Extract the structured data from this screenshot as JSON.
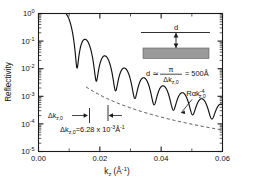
{
  "figure": {
    "name": "x-ray-reflectivity-kiessig-fringes"
  },
  "axes": {
    "ylabel": "Reflectivity",
    "xlabel_base": "k",
    "xlabel_sub": "z",
    "xlabel_unit": "(Å",
    "xlabel_unit_exp": "-1",
    "xlabel_unit_close": ")",
    "xticklabels": [
      "0.00",
      "0.02",
      "0.04",
      "0.06"
    ],
    "yticklabels": [
      "10",
      "10",
      "10",
      "10",
      "10",
      "10"
    ],
    "ytickexps": [
      "0",
      "-1",
      "-2",
      "-3",
      "-4",
      "-5"
    ]
  },
  "annotations": {
    "envelope_label_base": "R",
    "envelope_label_prop": "α",
    "envelope_label_k": "k",
    "envelope_label_sub": "z,0",
    "envelope_label_exp": "-4",
    "spacing_arrow_label_d": "Δk",
    "spacing_arrow_label_sub": "z,0",
    "spacing_eq_delta": "Δk",
    "spacing_eq_sub": "z,0",
    "spacing_eq_value": "=6.28 x 10",
    "spacing_eq_exp": "-3",
    "spacing_eq_unit": "Å",
    "spacing_eq_unit_exp": "-1"
  },
  "inset": {
    "thickness_label": "d",
    "formula_lhs": "d",
    "formula_approx": "≃",
    "formula_num": "π",
    "formula_den_base": "Δk",
    "formula_den_sub": "z,0",
    "formula_eq": "= 500Å"
  },
  "colors": {
    "axis": "#1a1a1a",
    "curve": "#111111",
    "envelope": "#333333",
    "substrate": "#9a9a9a",
    "background": "#ffffff"
  },
  "chart_data": {
    "type": "line",
    "title": "",
    "xlabel": "k_z (Å^-1)",
    "ylabel": "Reflectivity",
    "xlim": [
      0.0,
      0.06
    ],
    "ylim": [
      1e-05,
      1.0
    ],
    "yscale": "log",
    "grid": false,
    "legend": false,
    "critical_edge_kz": 0.0092,
    "fringe_spacing_dkz": 0.00628,
    "film_thickness_angstrom": 500,
    "series": [
      {
        "name": "Reflectivity (Kiessig fringes)",
        "style": "solid",
        "comment": "R = 1 below critical edge, then Fresnel k^-4 decay modulated by cos^2(pi*kz/dkz) fringes"
      },
      {
        "name": "R ∝ k_z^-4 envelope",
        "style": "dashed",
        "x": [
          0.0155,
          0.06
        ],
        "y": [
          0.0022,
          6e-05
        ]
      }
    ],
    "marked_fringe_positions": [
      0.0205,
      0.0268
    ]
  }
}
